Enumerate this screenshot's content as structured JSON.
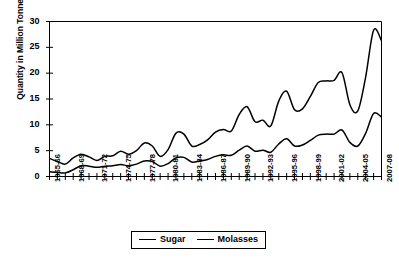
{
  "chart_data": {
    "type": "line",
    "title": "",
    "xlabel": "",
    "ylabel": "Quantity in Million Tonnes",
    "ylim": [
      0,
      30
    ],
    "yticks": [
      0,
      5,
      10,
      15,
      20,
      25,
      30
    ],
    "grid": false,
    "legend_position": "bottom-center",
    "x": [
      "1965-66",
      "1966-67",
      "1967-68",
      "1968-69",
      "1969-70",
      "1970-71",
      "1971-72",
      "1972-73",
      "1973-74",
      "1974-75",
      "1975-76",
      "1976-77",
      "1977-78",
      "1978-79",
      "1979-80",
      "1980-81",
      "1981-82",
      "1982-83",
      "1983-84",
      "1984-85",
      "1985-86",
      "1986-87",
      "1987-88",
      "1988-89",
      "1989-90",
      "1990-91",
      "1991-92",
      "1992-93",
      "1993-94",
      "1994-95",
      "1995-96",
      "1996-97",
      "1997-98",
      "1998-99",
      "1999-00",
      "2000-01",
      "2001-02",
      "2002-03",
      "2003-04",
      "2004-05",
      "2005-06",
      "2006-07",
      "2007-08"
    ],
    "xtick_labels": [
      "1965-66",
      "1968-69",
      "1971-72",
      "1974-75",
      "1977-78",
      "1980-81",
      "1983-84",
      "1986-87",
      "1989-90",
      "1992-93",
      "1995-96",
      "1998-99",
      "2001-02",
      "2004-05",
      "2007-08"
    ],
    "xtick_every": 3,
    "series": [
      {
        "name": "Sugar",
        "color": "#000000",
        "values": [
          3.5,
          2.9,
          2.4,
          3.6,
          4.3,
          3.8,
          3.1,
          3.9,
          4.0,
          4.9,
          4.3,
          5.0,
          6.5,
          5.9,
          3.9,
          5.2,
          8.4,
          8.2,
          5.9,
          6.2,
          7.1,
          8.6,
          9.1,
          8.8,
          12.0,
          13.5,
          10.6,
          10.9,
          9.8,
          14.6,
          16.5,
          12.9,
          13.1,
          15.5,
          18.2,
          18.5,
          18.6,
          20.1,
          13.9,
          12.7,
          19.3,
          28.3,
          26.3
        ]
      },
      {
        "name": "Molasses",
        "color": "#000000",
        "values": [
          0.9,
          0.8,
          0.7,
          1.3,
          2.1,
          2.0,
          1.8,
          2.0,
          2.1,
          2.3,
          2.1,
          2.4,
          3.0,
          2.9,
          2.0,
          2.5,
          3.6,
          3.7,
          2.8,
          3.0,
          3.3,
          3.9,
          4.2,
          4.1,
          5.1,
          5.9,
          4.9,
          5.1,
          4.7,
          6.3,
          7.3,
          5.9,
          6.1,
          7.0,
          8.0,
          8.2,
          8.2,
          9.0,
          6.6,
          5.9,
          8.4,
          12.2,
          11.5
        ]
      }
    ]
  },
  "legend": {
    "items": [
      {
        "label": "Sugar"
      },
      {
        "label": "Molasses"
      }
    ]
  }
}
